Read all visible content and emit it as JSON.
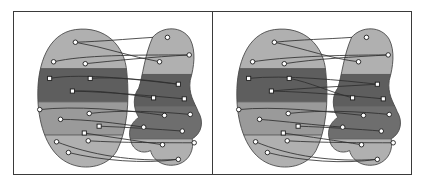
{
  "figure": {
    "panel_count": 2,
    "background_color": "#ffffff",
    "frame_color": "#3a3a3a"
  },
  "palette": {
    "cluster_light": "#b0b0b0",
    "cluster_mid": "#9a9a9a",
    "cluster_dark": "#6e6e6e",
    "cluster_darkest": "#5e5e5e",
    "outline": "#4a4a4a",
    "edge_color": "#2e2e2e",
    "node_fill": "#ffffff",
    "node_stroke": "#1c1c1c"
  },
  "panels": [
    {
      "id": "panel-left",
      "label": "Left panel",
      "left_blob": {
        "name": "left-source-blob",
        "shape": "oval",
        "path": "M 62 18 C 92 14 112 34 114 62 C 117 92 114 122 104 142 C 94 160 68 164 50 152 C 32 140 24 112 24 84 C 24 54 34 22 62 18 Z",
        "strata": [
          {
            "name": "stratum-light-top",
            "tone": "cluster_light",
            "y_from": 14,
            "y_to": 58
          },
          {
            "name": "stratum-darkest",
            "tone": "cluster_darkest",
            "y_from": 58,
            "y_to": 92
          },
          {
            "name": "stratum-mid",
            "tone": "cluster_mid",
            "y_from": 92,
            "y_to": 126
          },
          {
            "name": "stratum-light-bottom",
            "tone": "cluster_light",
            "y_from": 126,
            "y_to": 166
          }
        ],
        "nodes": [
          {
            "id": "L1",
            "shape": "circle",
            "x": 62,
            "y": 31
          },
          {
            "id": "L2",
            "shape": "circle",
            "x": 40,
            "y": 51
          },
          {
            "id": "L3",
            "shape": "circle",
            "x": 72,
            "y": 53
          },
          {
            "id": "L4",
            "shape": "square",
            "x": 36,
            "y": 68
          },
          {
            "id": "L5",
            "shape": "square",
            "x": 77,
            "y": 68
          },
          {
            "id": "L6",
            "shape": "square",
            "x": 59,
            "y": 81
          },
          {
            "id": "L7",
            "shape": "circle",
            "x": 26,
            "y": 100
          },
          {
            "id": "L8",
            "shape": "circle",
            "x": 47,
            "y": 110
          },
          {
            "id": "L9",
            "shape": "circle",
            "x": 76,
            "y": 104
          },
          {
            "id": "L10",
            "shape": "square",
            "x": 86,
            "y": 117
          },
          {
            "id": "L11",
            "shape": "square",
            "x": 71,
            "y": 124
          },
          {
            "id": "L12",
            "shape": "circle",
            "x": 43,
            "y": 133
          },
          {
            "id": "L13",
            "shape": "circle",
            "x": 75,
            "y": 132
          },
          {
            "id": "L14",
            "shape": "circle",
            "x": 55,
            "y": 144
          }
        ]
      },
      "right_blob": {
        "name": "right-target-blob",
        "shape": "irregular",
        "path": "M 140 26 C 150 14 170 14 178 28 C 184 40 182 56 178 70 C 176 84 182 92 186 102 C 192 112 190 124 180 130 C 182 140 178 152 166 156 C 152 160 140 152 138 142 C 130 146 120 142 118 132 C 114 120 120 112 126 108 C 120 98 120 86 126 78 C 130 66 132 44 140 26 Z",
        "strata": [
          {
            "name": "stratum-light-top",
            "tone": "cluster_light",
            "y_from": 14,
            "y_to": 64
          },
          {
            "name": "stratum-darkest",
            "tone": "cluster_darkest",
            "y_from": 64,
            "y_to": 96
          },
          {
            "name": "stratum-dark",
            "tone": "cluster_dark",
            "y_from": 96,
            "y_to": 130
          },
          {
            "name": "stratum-light-bottom",
            "tone": "cluster_light",
            "y_from": 130,
            "y_to": 166
          }
        ],
        "nodes": [
          {
            "id": "R1",
            "shape": "circle",
            "x": 155,
            "y": 26
          },
          {
            "id": "R2",
            "shape": "circle",
            "x": 177,
            "y": 44
          },
          {
            "id": "R3",
            "shape": "circle",
            "x": 147,
            "y": 51
          },
          {
            "id": "R4",
            "shape": "square",
            "x": 166,
            "y": 74
          },
          {
            "id": "R5",
            "shape": "square",
            "x": 141,
            "y": 88
          },
          {
            "id": "R6",
            "shape": "square",
            "x": 172,
            "y": 89
          },
          {
            "id": "R7",
            "shape": "circle",
            "x": 152,
            "y": 106
          },
          {
            "id": "R8",
            "shape": "circle",
            "x": 178,
            "y": 105
          },
          {
            "id": "R9",
            "shape": "circle",
            "x": 131,
            "y": 118
          },
          {
            "id": "R10",
            "shape": "circle",
            "x": 170,
            "y": 122
          },
          {
            "id": "R11",
            "shape": "circle",
            "x": 150,
            "y": 136
          },
          {
            "id": "R12",
            "shape": "circle",
            "x": 182,
            "y": 134
          },
          {
            "id": "R13",
            "shape": "circle",
            "x": 166,
            "y": 151
          }
        ]
      },
      "edges": [
        {
          "from": "L1",
          "to": "R1"
        },
        {
          "from": "L1",
          "to": "R3"
        },
        {
          "from": "L2",
          "to": "R2"
        },
        {
          "from": "L3",
          "to": "R2"
        },
        {
          "from": "L4",
          "to": "R4"
        },
        {
          "from": "L5",
          "to": "R4"
        },
        {
          "from": "L6",
          "to": "R5"
        },
        {
          "from": "L6",
          "to": "R6"
        },
        {
          "from": "L7",
          "to": "R7"
        },
        {
          "from": "L8",
          "to": "R9"
        },
        {
          "from": "L9",
          "to": "R8"
        },
        {
          "from": "L10",
          "to": "R10"
        },
        {
          "from": "L11",
          "to": "R11"
        },
        {
          "from": "L12",
          "to": "R13"
        },
        {
          "from": "L13",
          "to": "R12"
        },
        {
          "from": "L14",
          "to": "R13"
        }
      ],
      "edge_paths": [
        "M 62 31 C 90 30 110 28 140 26",
        "M 62 31 C 92 36 118 46 147 51",
        "M 40 51 C 70 44 120 44 177 44",
        "M 72 53 C 100 50 140 46 177 44",
        "M 36 68 C 70 62 130 70 166 74",
        "M 77 68 C 100 66 140 70 166 74",
        "M 59 81 C 86 80 112 84 141 88",
        "M 59 81 C 96 82 140 86 172 89",
        "M 26 100 C 60 96 112 100 152 106",
        "M 47 110 C 74 110 104 114 131 118",
        "M 76 104 C 108 100 148 102 178 105",
        "M 86 117 C 112 118 144 120 170 122",
        "M 71 124 C 96 128 124 132 150 136",
        "M 43 133 C 76 146 120 154 166 151",
        "M 75 132 C 108 134 152 134 182 134",
        "M 55 144 C 88 152 130 156 166 151"
      ]
    },
    {
      "id": "panel-right",
      "label": "Right panel",
      "left_blob": {
        "name": "left-source-blob",
        "shape": "oval",
        "path": "M 62 18 C 92 14 112 34 114 62 C 117 92 114 122 104 142 C 94 160 68 164 50 152 C 32 140 24 112 24 84 C 24 54 34 22 62 18 Z",
        "strata": [
          {
            "name": "stratum-light-top",
            "tone": "cluster_light",
            "y_from": 14,
            "y_to": 58
          },
          {
            "name": "stratum-darkest",
            "tone": "cluster_darkest",
            "y_from": 58,
            "y_to": 92
          },
          {
            "name": "stratum-mid",
            "tone": "cluster_mid",
            "y_from": 92,
            "y_to": 126
          },
          {
            "name": "stratum-light-bottom",
            "tone": "cluster_light",
            "y_from": 126,
            "y_to": 166
          }
        ],
        "nodes": [
          {
            "id": "L1",
            "shape": "circle",
            "x": 62,
            "y": 31
          },
          {
            "id": "L2",
            "shape": "circle",
            "x": 40,
            "y": 51
          },
          {
            "id": "L3",
            "shape": "circle",
            "x": 72,
            "y": 53
          },
          {
            "id": "L4",
            "shape": "square",
            "x": 36,
            "y": 68
          },
          {
            "id": "L5",
            "shape": "square",
            "x": 77,
            "y": 68
          },
          {
            "id": "L6",
            "shape": "square",
            "x": 59,
            "y": 81
          },
          {
            "id": "L7",
            "shape": "circle",
            "x": 26,
            "y": 100
          },
          {
            "id": "L8",
            "shape": "circle",
            "x": 47,
            "y": 110
          },
          {
            "id": "L9",
            "shape": "circle",
            "x": 76,
            "y": 104
          },
          {
            "id": "L10",
            "shape": "square",
            "x": 86,
            "y": 117
          },
          {
            "id": "L11",
            "shape": "square",
            "x": 71,
            "y": 124
          },
          {
            "id": "L12",
            "shape": "circle",
            "x": 43,
            "y": 133
          },
          {
            "id": "L13",
            "shape": "circle",
            "x": 75,
            "y": 132
          },
          {
            "id": "L14",
            "shape": "circle",
            "x": 55,
            "y": 144
          }
        ]
      },
      "right_blob": {
        "name": "right-target-blob",
        "shape": "irregular",
        "path": "M 140 26 C 150 14 170 14 178 28 C 184 40 182 56 178 70 C 176 84 182 92 186 102 C 192 112 190 124 180 130 C 182 140 178 152 166 156 C 152 160 140 152 138 142 C 130 146 120 142 118 132 C 114 120 120 112 126 108 C 120 98 120 86 126 78 C 130 66 132 44 140 26 Z",
        "strata": [
          {
            "name": "stratum-light-top",
            "tone": "cluster_light",
            "y_from": 14,
            "y_to": 64
          },
          {
            "name": "stratum-darkest",
            "tone": "cluster_darkest",
            "y_from": 64,
            "y_to": 96
          },
          {
            "name": "stratum-dark",
            "tone": "cluster_dark",
            "y_from": 96,
            "y_to": 130
          },
          {
            "name": "stratum-light-bottom",
            "tone": "cluster_light",
            "y_from": 130,
            "y_to": 166
          }
        ],
        "nodes": [
          {
            "id": "R1",
            "shape": "circle",
            "x": 155,
            "y": 26
          },
          {
            "id": "R2",
            "shape": "circle",
            "x": 177,
            "y": 44
          },
          {
            "id": "R3",
            "shape": "circle",
            "x": 147,
            "y": 51
          },
          {
            "id": "R4",
            "shape": "square",
            "x": 166,
            "y": 74
          },
          {
            "id": "R5",
            "shape": "square",
            "x": 141,
            "y": 88
          },
          {
            "id": "R6",
            "shape": "square",
            "x": 172,
            "y": 89
          },
          {
            "id": "R7",
            "shape": "circle",
            "x": 152,
            "y": 106
          },
          {
            "id": "R8",
            "shape": "circle",
            "x": 178,
            "y": 105
          },
          {
            "id": "R9",
            "shape": "circle",
            "x": 131,
            "y": 118
          },
          {
            "id": "R10",
            "shape": "circle",
            "x": 170,
            "y": 122
          },
          {
            "id": "R11",
            "shape": "circle",
            "x": 150,
            "y": 136
          },
          {
            "id": "R12",
            "shape": "circle",
            "x": 182,
            "y": 134
          },
          {
            "id": "R13",
            "shape": "circle",
            "x": 166,
            "y": 151
          }
        ]
      },
      "edges": [
        {
          "from": "L1",
          "to": "R1"
        },
        {
          "from": "L1",
          "to": "R3"
        },
        {
          "from": "L2",
          "to": "R2"
        },
        {
          "from": "L3",
          "to": "R2"
        },
        {
          "from": "L4",
          "to": "R4"
        },
        {
          "from": "L5",
          "to": "R5"
        },
        {
          "from": "L6",
          "to": "R6"
        },
        {
          "from": "L6",
          "to": "R4"
        },
        {
          "from": "L7",
          "to": "R7"
        },
        {
          "from": "L8",
          "to": "R9"
        },
        {
          "from": "L9",
          "to": "R8"
        },
        {
          "from": "L10",
          "to": "R10"
        },
        {
          "from": "L11",
          "to": "R11"
        },
        {
          "from": "L12",
          "to": "R13"
        },
        {
          "from": "L13",
          "to": "R12"
        },
        {
          "from": "L14",
          "to": "R13"
        }
      ],
      "edge_paths": [
        "M 62 31 C 92 28 112 28 140 26",
        "M 62 31 C 94 38 120 48 147 51",
        "M 40 51 C 72 46 122 44 177 44",
        "M 72 53 C 104 48 142 46 177 44",
        "M 36 68 C 72 64 130 70 166 74",
        "M 77 68 C 98 72 118 82 141 88",
        "M 59 81 C 98 82 142 86 172 89",
        "M 59 81 C 90 78 134 76 166 74",
        "M 26 100 C 62 96 114 102 152 106",
        "M 47 110 C 72 112 104 116 131 118",
        "M 76 104 C 110 100 150 102 178 105",
        "M 86 117 C 114 118 146 120 170 122",
        "M 71 124 C 98 128 126 132 150 136",
        "M 43 133 C 78 148 122 154 166 151",
        "M 75 132 C 110 134 154 134 182 134",
        "M 55 144 C 90 153 132 156 166 151"
      ]
    }
  ]
}
